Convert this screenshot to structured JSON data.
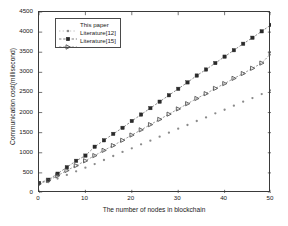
{
  "chart_data": {
    "type": "scatter",
    "title": "",
    "xlabel": "The number of nodes in blockchain",
    "ylabel": "Communication cost(millisecond)",
    "xlim": [
      0,
      50
    ],
    "ylim": [
      0,
      4500
    ],
    "xticks": [
      0,
      10,
      20,
      30,
      40,
      50
    ],
    "yticks": [
      0,
      500,
      1000,
      1500,
      2000,
      2500,
      3000,
      3500,
      4000,
      4500
    ],
    "grid": false,
    "legend_position": "upper-left-inside",
    "x": [
      0,
      2,
      4,
      6,
      8,
      10,
      12,
      14,
      16,
      18,
      20,
      22,
      24,
      26,
      28,
      30,
      32,
      34,
      36,
      38,
      40,
      42,
      44,
      46,
      48,
      50
    ],
    "series": [
      {
        "name": "This paper",
        "marker": "dot",
        "color": "#8a8a8a",
        "line": "none",
        "values": [
          200,
          270,
          360,
          450,
          540,
          630,
          720,
          820,
          920,
          1020,
          1110,
          1210,
          1300,
          1400,
          1500,
          1600,
          1690,
          1790,
          1880,
          1980,
          2070,
          2170,
          2270,
          2360,
          2460,
          2550
        ]
      },
      {
        "name": "Literature[12]",
        "marker": "square",
        "color": "#2a2a2a",
        "line": "dashed",
        "values": [
          250,
          330,
          480,
          640,
          800,
          930,
          1150,
          1310,
          1470,
          1620,
          1790,
          1950,
          2110,
          2270,
          2430,
          2590,
          2750,
          2920,
          3070,
          3230,
          3390,
          3550,
          3710,
          3860,
          4020,
          4180
        ]
      },
      {
        "name": "Literature[15]",
        "marker": "triangle-right",
        "color": "#4a4a4a",
        "line": "dashed",
        "values": [
          230,
          310,
          430,
          560,
          680,
          800,
          930,
          1060,
          1180,
          1310,
          1440,
          1570,
          1700,
          1830,
          1960,
          2090,
          2220,
          2350,
          2470,
          2600,
          2720,
          2850,
          2970,
          3100,
          3230,
          3470
        ]
      }
    ]
  },
  "legend": {
    "items": [
      {
        "label": "This paper"
      },
      {
        "label": "Literature[12]"
      },
      {
        "label": "Literature[15]"
      }
    ]
  }
}
